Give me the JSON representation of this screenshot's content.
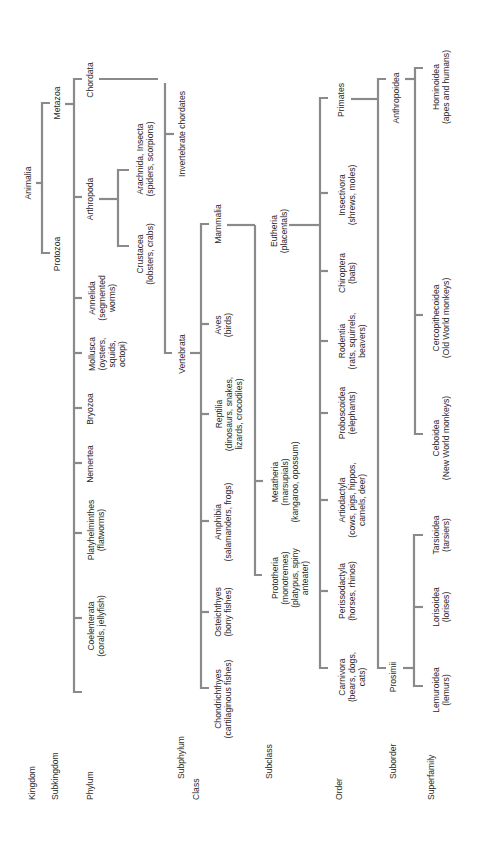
{
  "diagram": {
    "type": "taxonomy-tree",
    "orientation": "rotated-90-ccw",
    "line_color": "#8a8a8a",
    "text_color": "#2a2a2a",
    "levels": [
      {
        "id": "kingdom",
        "label": "Kingdom"
      },
      {
        "id": "subkingdom",
        "label": "Subkingdom"
      },
      {
        "id": "phylum",
        "label": "Phylum"
      },
      {
        "id": "subphylum",
        "label": "Subphylum"
      },
      {
        "id": "class",
        "label": "Class"
      },
      {
        "id": "subclass",
        "label": "Subclass"
      },
      {
        "id": "order",
        "label": "Order"
      },
      {
        "id": "suborder",
        "label": "Suborder"
      },
      {
        "id": "superfamily",
        "label": "Superfamily"
      }
    ],
    "nodes": {
      "animalia": "Animalia",
      "protozoa": "Protozoa",
      "metazoa": "Metazoa",
      "chordata": "Chordata",
      "arthropoda": "Arthropoda",
      "annelida": "Annelida\n(segmented\nworms)",
      "mollusca": "Mollusca\n(oysters,\nsquids,\noctopi)",
      "bryozoa": "Bryozoa",
      "nemertea": "Nemertea",
      "platyhelminthes": "Platyhelminthes\n(flatworms)",
      "coelenterata": "Coelenterata\n(corals, jellyfish)",
      "arachnida": "Arachnida, Insecta\n(spiders, scorpions)",
      "crustacea": "Crustacea\n(lobsters, crabs)",
      "invertebrate_chordates": "Invertebrate chordates",
      "vertebrata": "Vertebrata",
      "mammalia": "Mammalia",
      "aves": "Aves\n(birds)",
      "reptilia": "Reptilia\n(dinosaurs, snakes,\nlizards, crocodiles)",
      "amphibia": "Amphibia\n(salamanders, frogs)",
      "osteichthyes": "Osteichthyes\n(bony fishes)",
      "chondrichthyes": "Chondrichthyes\n(cartilaginous fishes)",
      "eutheria": "Eutheria\n(placentals)",
      "metatheria": "Metatheria\n(marsupials)\n(kangaroo, opossum)",
      "prototheria": "Prototheria\n(monotremes)\n(platypus, spiny\nanteater)",
      "primates": "Primates",
      "insectivora": "Insectivora\n(shrews, moles)",
      "chiroptera": "Chiroptera\n(bats)",
      "rodentia": "Rodentia\n(rats, squirrels,\nbeavers)",
      "proboscoidea": "Proboscoidea\n(elephants)",
      "artiodactyla": "Artiodactyla\n(cows, pigs, hippos,\ncamels, deer)",
      "perissodactyla": "Perissodactyla\n(horses, rhinos)",
      "carnivora": "Carnivora\n(bears, dogs,\ncats)",
      "anthropoidea": "Anthropoidea",
      "prosimii": "Prosimii",
      "hominoidea": "Hominoidea\n(apes and humans)",
      "cercopithecoidea": "Cercopithecoidea\n(Old World monkeys)",
      "ceboidea": "Ceboidea\n(New World monkeys)",
      "tarsioidea": "Tarsioidea\n(tarsiers)",
      "lorisoidea": "Lorisoidea\n(lorises)",
      "lemuroidea": "Lemuroidea\n(lemurs)"
    },
    "edges": [
      [
        "Animalia",
        "Protozoa"
      ],
      [
        "Animalia",
        "Metazoa"
      ],
      [
        "Metazoa",
        "Chordata"
      ],
      [
        "Metazoa",
        "Arthropoda"
      ],
      [
        "Metazoa",
        "Annelida"
      ],
      [
        "Metazoa",
        "Mollusca"
      ],
      [
        "Metazoa",
        "Bryozoa"
      ],
      [
        "Metazoa",
        "Nemertea"
      ],
      [
        "Metazoa",
        "Platyhelminthes"
      ],
      [
        "Metazoa",
        "Coelenterata"
      ],
      [
        "Arthropoda",
        "Arachnida, Insecta"
      ],
      [
        "Arthropoda",
        "Crustacea"
      ],
      [
        "Chordata",
        "Invertebrate chordates"
      ],
      [
        "Chordata",
        "Vertebrata"
      ],
      [
        "Vertebrata",
        "Mammalia"
      ],
      [
        "Vertebrata",
        "Aves"
      ],
      [
        "Vertebrata",
        "Reptilia"
      ],
      [
        "Vertebrata",
        "Amphibia"
      ],
      [
        "Vertebrata",
        "Osteichthyes"
      ],
      [
        "Vertebrata",
        "Chondrichthyes"
      ],
      [
        "Mammalia",
        "Eutheria"
      ],
      [
        "Mammalia",
        "Metatheria"
      ],
      [
        "Mammalia",
        "Prototheria"
      ],
      [
        "Eutheria",
        "Primates"
      ],
      [
        "Eutheria",
        "Insectivora"
      ],
      [
        "Eutheria",
        "Chiroptera"
      ],
      [
        "Eutheria",
        "Rodentia"
      ],
      [
        "Eutheria",
        "Proboscoidea"
      ],
      [
        "Eutheria",
        "Artiodactyla"
      ],
      [
        "Eutheria",
        "Perissodactyla"
      ],
      [
        "Eutheria",
        "Carnivora"
      ],
      [
        "Primates",
        "Anthropoidea"
      ],
      [
        "Primates",
        "Prosimii"
      ],
      [
        "Anthropoidea",
        "Hominoidea"
      ],
      [
        "Anthropoidea",
        "Cercopithecoidea"
      ],
      [
        "Anthropoidea",
        "Ceboidea"
      ],
      [
        "Prosimii",
        "Tarsioidea"
      ],
      [
        "Prosimii",
        "Lorisoidea"
      ],
      [
        "Prosimii",
        "Lemuroidea"
      ]
    ]
  }
}
